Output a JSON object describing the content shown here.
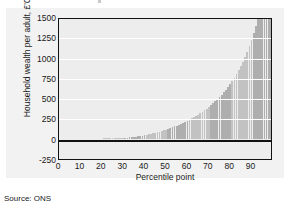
{
  "source_note": "Source: ONS",
  "chart_data": {
    "type": "bar",
    "title": "",
    "xlabel": "Percentile point",
    "ylabel": "Household wealth per adult, £'000",
    "xlim": [
      0,
      100
    ],
    "ylim": [
      -250,
      1500
    ],
    "xticks": [
      0,
      10,
      20,
      30,
      40,
      50,
      60,
      70,
      80,
      90
    ],
    "yticks": [
      -250,
      0,
      250,
      500,
      750,
      1000,
      1250,
      1500
    ],
    "xticklabels": [
      "0",
      "10",
      "20",
      "30",
      "40",
      "50",
      "60",
      "70",
      "80",
      "90"
    ],
    "yticklabels": [
      "-250",
      "0",
      "250",
      "500",
      "750",
      "1000",
      "1250",
      "1500"
    ],
    "grid": true,
    "legend": null,
    "bar_color": "#b8b8b8",
    "plot_bg": "#ededed",
    "gridline_color": "#ffffff",
    "axis_color": "#111111",
    "categories": [
      1,
      2,
      3,
      4,
      5,
      6,
      7,
      8,
      9,
      10,
      11,
      12,
      13,
      14,
      15,
      16,
      17,
      18,
      19,
      20,
      21,
      22,
      23,
      24,
      25,
      26,
      27,
      28,
      29,
      30,
      31,
      32,
      33,
      34,
      35,
      36,
      37,
      38,
      39,
      40,
      41,
      42,
      43,
      44,
      45,
      46,
      47,
      48,
      49,
      50,
      51,
      52,
      53,
      54,
      55,
      56,
      57,
      58,
      59,
      60,
      61,
      62,
      63,
      64,
      65,
      66,
      67,
      68,
      69,
      70,
      71,
      72,
      73,
      74,
      75,
      76,
      77,
      78,
      79,
      80,
      81,
      82,
      83,
      84,
      85,
      86,
      87,
      88,
      89,
      90,
      91,
      92,
      93,
      94,
      95,
      96,
      97,
      98,
      99
    ],
    "values": [
      0,
      0,
      0,
      0,
      0,
      0,
      0,
      0,
      0,
      0,
      0,
      0,
      0,
      0,
      0,
      0,
      1,
      1,
      2,
      2,
      3,
      3,
      4,
      5,
      5,
      6,
      7,
      8,
      9,
      10,
      12,
      14,
      16,
      19,
      22,
      25,
      29,
      33,
      38,
      43,
      48,
      54,
      60,
      66,
      73,
      80,
      88,
      96,
      104,
      113,
      122,
      131,
      141,
      151,
      162,
      173,
      185,
      197,
      210,
      223,
      237,
      251,
      266,
      282,
      298,
      315,
      333,
      352,
      372,
      393,
      415,
      438,
      462,
      487,
      514,
      542,
      572,
      604,
      638,
      674,
      712,
      753,
      797,
      844,
      895,
      950,
      1009,
      1073,
      1142,
      1217,
      1298,
      1386,
      1482,
      1587,
      1701,
      1826,
      1963,
      2113,
      2277
    ],
    "values_note": "Household wealth per adult in £'000 at each percentile point; curve rises from near zero below the 30th percentile to about 1350 at the top percentile shown."
  }
}
